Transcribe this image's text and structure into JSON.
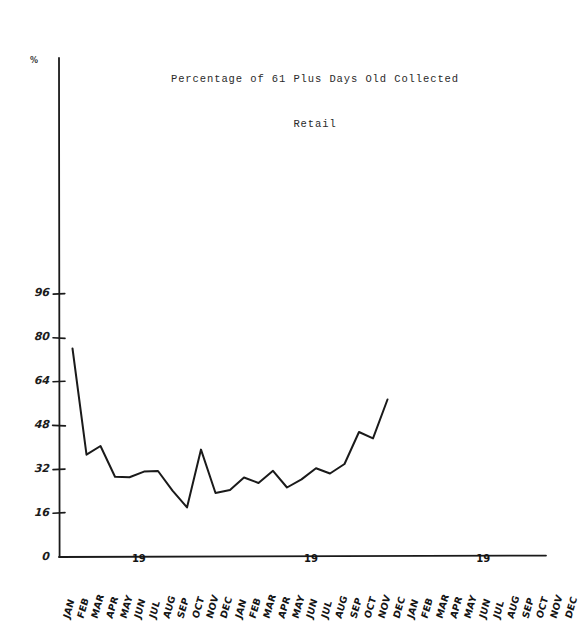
{
  "chart_data": {
    "type": "line",
    "title": "Percentage of 61 Plus Days Old Collected",
    "subtitle": "Retail",
    "xlabel": "",
    "ylabel": "%",
    "ylim": [
      0,
      112
    ],
    "yticks": [
      0,
      16,
      32,
      48,
      64,
      80,
      96
    ],
    "grid": false,
    "legend": "none",
    "categories": [
      "JAN",
      "FEB",
      "MAR",
      "APR",
      "MAY",
      "JUN",
      "JUL",
      "AUG",
      "SEP",
      "OCT",
      "NOV",
      "DEC",
      "JAN",
      "FEB",
      "MAR",
      "APR",
      "MAY",
      "JUN",
      "JUL",
      "AUG",
      "SEP",
      "OCT",
      "NOV",
      "DEC",
      "JAN",
      "FEB",
      "MAR",
      "APR",
      "MAY",
      "JUN",
      "JUL",
      "AUG",
      "SEP",
      "OCT",
      "NOV",
      "DEC"
    ],
    "values": [
      76,
      37,
      40,
      29,
      29,
      31,
      31,
      24,
      18,
      39,
      23,
      24,
      29,
      27,
      31,
      25,
      28,
      32,
      30,
      33,
      45,
      43,
      57,
      null,
      null,
      null,
      null,
      null,
      null,
      null,
      null,
      null,
      null,
      null,
      null,
      null
    ],
    "year_markers": [
      {
        "label": "19",
        "category_index": 4
      },
      {
        "label": "19",
        "category_index": 16
      },
      {
        "label": "19",
        "category_index": 28
      }
    ],
    "series_color": "#1a1a1a",
    "axis_color": "#1a1a1a"
  },
  "colors": {
    "background": "#ffffff",
    "ink": "#1a1a1a",
    "title_ink": "#2a2a2a"
  }
}
